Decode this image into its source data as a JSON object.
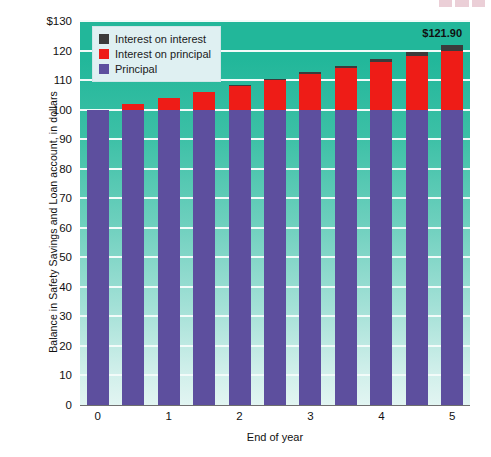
{
  "chart_data": {
    "type": "bar",
    "title": "",
    "subtitle": "",
    "xlabel": "End of year",
    "ylabel": "Balance in Safety Savings and Loan account, in dollars",
    "stacked": true,
    "grid": true,
    "legend_position": "top-left",
    "ylim": [
      0,
      130
    ],
    "ytick_labels": [
      "$130",
      "120",
      "110",
      "100",
      "90",
      "80",
      "70",
      "60",
      "50",
      "40",
      "30",
      "20",
      "10",
      "0"
    ],
    "ytick_values": [
      130,
      120,
      110,
      100,
      90,
      80,
      70,
      60,
      50,
      40,
      30,
      20,
      10,
      0
    ],
    "xtick_labels": [
      "0",
      "1",
      "2",
      "3",
      "4",
      "5"
    ],
    "xtick_values": [
      0,
      1,
      2,
      3,
      4,
      5
    ],
    "x": [
      0,
      0.5,
      1,
      1.5,
      2,
      2.5,
      3,
      3.5,
      4,
      4.5,
      5
    ],
    "categories": [
      "0",
      "0.5",
      "1",
      "1.5",
      "2",
      "2.5",
      "3",
      "3.5",
      "4",
      "4.5",
      "5"
    ],
    "totals": [
      100.0,
      102.0,
      104.04,
      106.12,
      108.24,
      110.41,
      112.62,
      114.87,
      117.17,
      119.51,
      121.9
    ],
    "series": [
      {
        "name": "Principal",
        "color": "#5d4f9e",
        "values": [
          100.0,
          100.0,
          100.0,
          100.0,
          100.0,
          100.0,
          100.0,
          100.0,
          100.0,
          100.0,
          100.0
        ]
      },
      {
        "name": "Interest on principal",
        "color": "#ee1c17",
        "values": [
          0.0,
          2.0,
          4.0,
          6.0,
          8.0,
          10.0,
          12.0,
          14.0,
          16.0,
          18.0,
          20.0
        ]
      },
      {
        "name": "Interest on interest",
        "color": "#3b3b3b",
        "values": [
          0.0,
          0.0,
          0.04,
          0.12,
          0.24,
          0.41,
          0.62,
          0.87,
          1.17,
          1.51,
          1.9
        ]
      }
    ],
    "annotations": [
      {
        "text": "$121.90",
        "target_index": 10,
        "value": 121.9
      }
    ]
  },
  "legend": {
    "items": [
      {
        "label": "Interest on interest",
        "color": "#3b3b3b"
      },
      {
        "label": "Interest on principal",
        "color": "#ee1c17"
      },
      {
        "label": "Principal",
        "color": "#5d4f9e"
      }
    ]
  },
  "axes": {
    "y_title": "Balance in Safety Savings and Loan account, in dollars",
    "x_title": "End of year"
  },
  "colors": {
    "principal": "#5d4f9e",
    "interest_on_principal": "#ee1c17",
    "interest_on_interest": "#3b3b3b",
    "plot_background_top": "#22b79a",
    "plot_background_bottom": "#e2f5f2",
    "gridline": "#f2fbf9",
    "legend_background": "#dff0f2",
    "page_background": "#ffffff"
  }
}
